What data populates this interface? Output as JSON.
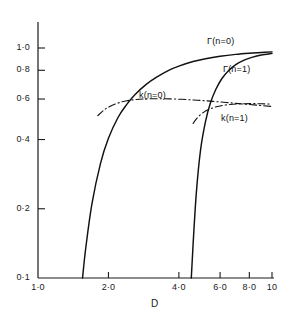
{
  "chart_data": {
    "type": "line",
    "title": "",
    "xlabel": "D",
    "ylabel": "",
    "xscale": "log",
    "yscale": "log",
    "xlim": [
      1.0,
      10.0
    ],
    "ylim": [
      0.1,
      1.05
    ],
    "grid": false,
    "legend_position": "inline-labels",
    "x_ticks": [
      {
        "value": 1.0,
        "label": "1·0"
      },
      {
        "value": 2.0,
        "label": "2·0"
      },
      {
        "value": 4.0,
        "label": "4·0"
      },
      {
        "value": 6.0,
        "label": "6·0"
      },
      {
        "value": 8.0,
        "label": "8·0"
      },
      {
        "value": 10.0,
        "label": "10"
      }
    ],
    "y_ticks": [
      {
        "value": 1.0,
        "label": "1·0"
      },
      {
        "value": 0.8,
        "label": "0·8"
      },
      {
        "value": 0.6,
        "label": "0·6"
      },
      {
        "value": 0.4,
        "label": "0·4"
      },
      {
        "value": 0.2,
        "label": "0·2"
      },
      {
        "value": 0.1,
        "label": "0·1"
      }
    ],
    "series": [
      {
        "name": "Γ(n=0)",
        "label": "Γ(n=0)",
        "style": "solid",
        "x": [
          1.55,
          1.6,
          1.7,
          1.85,
          2.0,
          2.2,
          2.4,
          2.6,
          2.9,
          3.2,
          3.6,
          4.0,
          4.6,
          5.2,
          6.0,
          7.0,
          8.0,
          9.0,
          10.0
        ],
        "y": [
          0.1,
          0.135,
          0.21,
          0.315,
          0.405,
          0.5,
          0.57,
          0.628,
          0.695,
          0.745,
          0.798,
          0.834,
          0.873,
          0.898,
          0.92,
          0.938,
          0.949,
          0.956,
          0.962
        ]
      },
      {
        "name": "Γ(n=1)",
        "label": "Γ(n=1)",
        "style": "solid",
        "x": [
          4.52,
          4.6,
          4.75,
          4.95,
          5.2,
          5.45,
          5.75,
          6.1,
          6.5,
          7.0,
          7.6,
          8.2,
          9.0,
          10.0
        ],
        "y": [
          0.1,
          0.14,
          0.235,
          0.36,
          0.48,
          0.575,
          0.66,
          0.735,
          0.795,
          0.847,
          0.886,
          0.91,
          0.932,
          0.948
        ]
      },
      {
        "name": "k(n=0)",
        "label": "k(n=0)",
        "style": "dashdot",
        "x": [
          1.8,
          1.95,
          2.15,
          2.4,
          2.8,
          3.3,
          4.0,
          4.8,
          5.6,
          6.6,
          7.8,
          9.0,
          10.0
        ],
        "y": [
          0.508,
          0.545,
          0.572,
          0.59,
          0.6,
          0.602,
          0.599,
          0.593,
          0.586,
          0.578,
          0.569,
          0.562,
          0.557
        ]
      },
      {
        "name": "k(n=1)",
        "label": "k(n=1)",
        "style": "dashdot",
        "x": [
          4.6,
          4.8,
          5.1,
          5.5,
          6.0,
          6.6,
          7.3,
          8.2,
          9.0,
          10.0
        ],
        "y": [
          0.47,
          0.498,
          0.525,
          0.546,
          0.56,
          0.568,
          0.572,
          0.573,
          0.572,
          0.57
        ]
      }
    ],
    "annotations": [
      {
        "name": "Γ(n=0)",
        "text": "Γ(n=0)",
        "x_px": 207,
        "y_px": 36
      },
      {
        "name": "Γ(n=1)",
        "text": "Γ(n=1)",
        "x_px": 223,
        "y_px": 64
      },
      {
        "name": "k(n=0)",
        "text": "k(n=0)",
        "x_px": 139,
        "y_px": 90
      },
      {
        "name": "k(n=1)",
        "text": "k(n=1)",
        "x_px": 221,
        "y_px": 113
      }
    ],
    "colors": {
      "axis": "#1a1a1a",
      "curve": "#111111",
      "background": "#ffffff"
    }
  },
  "axes": {
    "x_title": "D",
    "y_title": ""
  }
}
